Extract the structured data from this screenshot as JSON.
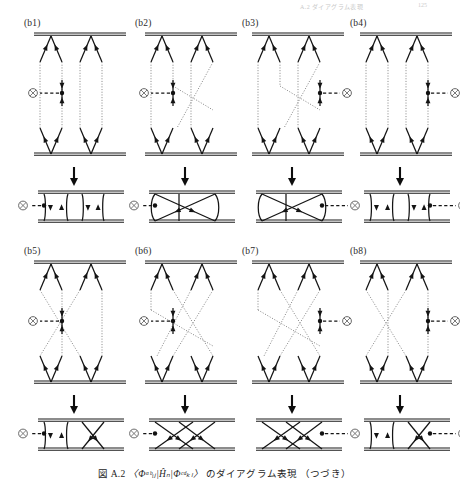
{
  "running_head": {
    "text": "A.2  ダイアグラム表現",
    "page_number": "125"
  },
  "caption": {
    "figure_number": "図 A.2",
    "expression": "〈Φᵃᵇᵢⱼ|Ĥₙ|Φᶜᵈₖₗ〉",
    "text": "のダイアグラム表現",
    "suffix": "（つづき）",
    "full": "図 A.2  〈Φᵃᵇᵢⱼ|Ĥₙ|Φᶜᵈₖₗ〉 のダイアグラム表現（つづき）"
  },
  "colors": {
    "ink": "#141414",
    "dotted_line": "#8e8e8e",
    "vertex_ring": "#5a5a5a",
    "background": "#ffffff"
  },
  "icons": {
    "interaction_vertex": "circled-cross-icon",
    "down_arrow": "down-arrow-icon",
    "fermion_arrow": "arrowhead-icon",
    "interaction_dot": "filled-dot-icon"
  },
  "panels": [
    {
      "id": "b1",
      "label": "(b1)",
      "row": 0,
      "col": 0,
      "vertex_side_top": "left",
      "vertex_side_bottom": "left",
      "top_topology": "uncrossed-double-loop",
      "bottom_topology": "two-lens-loops",
      "crossings": 0
    },
    {
      "id": "b2",
      "label": "(b2)",
      "row": 0,
      "col": 1,
      "vertex_side_top": "left",
      "vertex_side_bottom": "left",
      "top_topology": "single-crossed-long-dotted",
      "bottom_topology": "crossed-x-loops",
      "crossings": 1
    },
    {
      "id": "b3",
      "label": "(b3)",
      "row": 0,
      "col": 2,
      "vertex_side_top": "right",
      "vertex_side_bottom": "right",
      "top_topology": "single-crossed-long-dotted",
      "bottom_topology": "crossed-x-loops",
      "crossings": 1
    },
    {
      "id": "b4",
      "label": "(b4)",
      "row": 0,
      "col": 3,
      "vertex_side_top": "right",
      "vertex_side_bottom": "right",
      "top_topology": "uncrossed-double-loop",
      "bottom_topology": "two-lens-loops",
      "crossings": 0
    },
    {
      "id": "b5",
      "label": "(b5)",
      "row": 1,
      "col": 0,
      "vertex_side_top": "left",
      "vertex_side_bottom": "left",
      "top_topology": "crossed-dotted-x",
      "bottom_topology": "lens-plus-cross",
      "crossings": 1
    },
    {
      "id": "b6",
      "label": "(b6)",
      "row": 1,
      "col": 1,
      "vertex_side_top": "left",
      "vertex_side_bottom": "left",
      "top_topology": "double-crossed-dotted",
      "bottom_topology": "double-cross",
      "crossings": 2
    },
    {
      "id": "b7",
      "label": "(b7)",
      "row": 1,
      "col": 2,
      "vertex_side_top": "right",
      "vertex_side_bottom": "right",
      "top_topology": "double-crossed-dotted",
      "bottom_topology": "double-cross",
      "crossings": 2
    },
    {
      "id": "b8",
      "label": "(b8)",
      "row": 1,
      "col": 3,
      "vertex_side_top": "right",
      "vertex_side_bottom": "right",
      "top_topology": "crossed-dotted-x",
      "bottom_topology": "lens-plus-cross",
      "crossings": 1
    }
  ]
}
